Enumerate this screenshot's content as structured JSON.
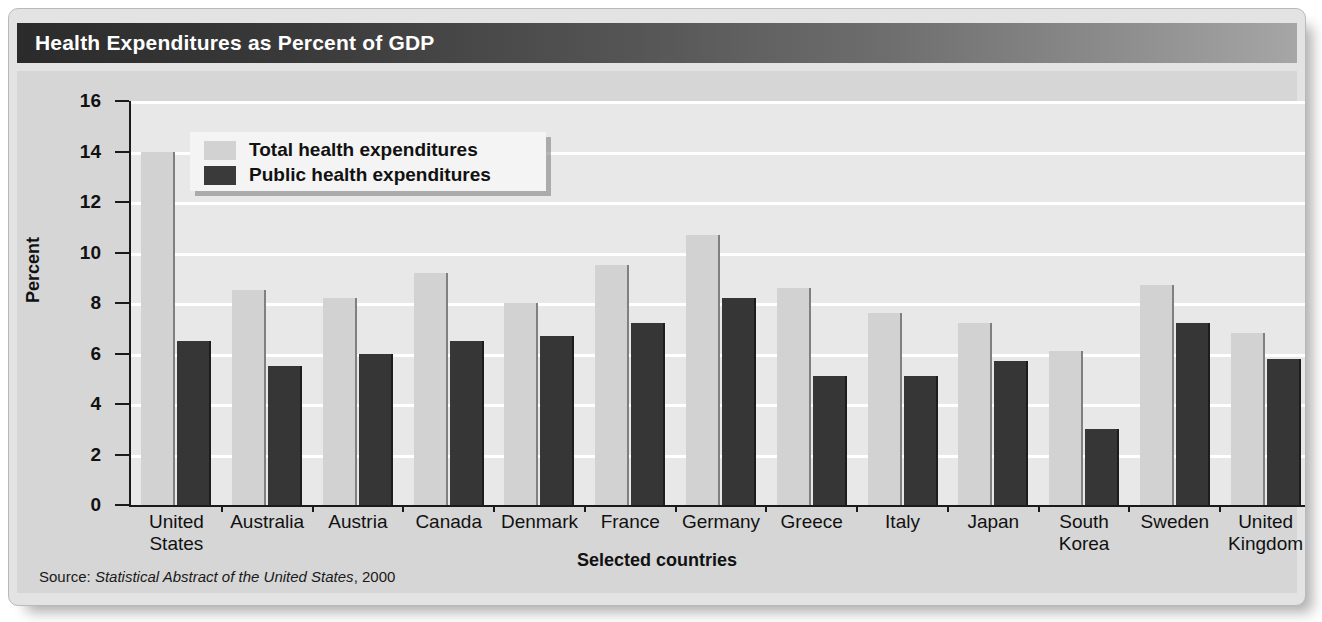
{
  "title": "Health Expenditures as Percent of GDP",
  "source": {
    "prefix": "Source:",
    "publication": "Statistical Abstract of the United States",
    "year": ", 2000"
  },
  "legend": {
    "total_label": "Total health expenditures",
    "public_label": "Public health expenditures"
  },
  "colors": {
    "total_bar": "#d2d2d2",
    "public_bar": "#363636",
    "plot_background": "#e8e8e8",
    "chart_background": "#d6d6d6",
    "gridline": "#ffffff",
    "title_bar_dark": "#2b2b2b",
    "title_bar_light": "#a6a6a6",
    "axis": "#1a1a1a"
  },
  "chart_data": {
    "type": "bar",
    "title": "Health Expenditures as Percent of GDP",
    "xlabel": "Selected countries",
    "ylabel": "Percent",
    "ylim": [
      0,
      16
    ],
    "yticks": [
      0,
      2,
      4,
      6,
      8,
      10,
      12,
      14,
      16
    ],
    "ytick_labels": [
      "0",
      "2",
      "4",
      "6",
      "8",
      "10",
      "12",
      "14",
      "16"
    ],
    "grid": true,
    "legend_position": "upper-left-inside",
    "categories": [
      "United States",
      "Australia",
      "Austria",
      "Canada",
      "Denmark",
      "France",
      "Germany",
      "Greece",
      "Italy",
      "Japan",
      "South Korea",
      "Sweden",
      "United Kingdom"
    ],
    "category_lines": [
      [
        "United",
        "States"
      ],
      [
        "Australia"
      ],
      [
        "Austria"
      ],
      [
        "Canada"
      ],
      [
        "Denmark"
      ],
      [
        "France"
      ],
      [
        "Germany"
      ],
      [
        "Greece"
      ],
      [
        "Italy"
      ],
      [
        "Japan"
      ],
      [
        "South",
        "Korea"
      ],
      [
        "Sweden"
      ],
      [
        "United",
        "Kingdom"
      ]
    ],
    "series": [
      {
        "name": "Total health expenditures",
        "color": "#d2d2d2",
        "values": [
          14.0,
          8.5,
          8.2,
          9.2,
          8.0,
          9.5,
          10.7,
          8.6,
          7.6,
          7.2,
          6.1,
          8.7,
          6.8
        ]
      },
      {
        "name": "Public health expenditures",
        "color": "#363636",
        "values": [
          6.5,
          5.5,
          6.0,
          6.5,
          6.7,
          7.2,
          8.2,
          5.1,
          5.1,
          5.7,
          3.0,
          7.2,
          5.8
        ]
      }
    ]
  }
}
